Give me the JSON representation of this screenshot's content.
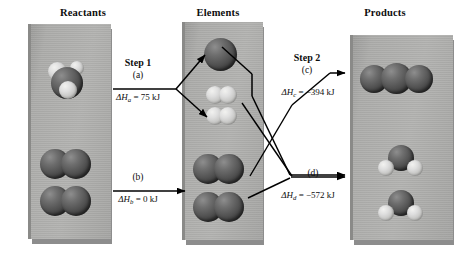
{
  "figure": {
    "type": "energy-diagram"
  },
  "columns": [
    {
      "key": "reactants",
      "title": "Reactants"
    },
    {
      "key": "elements",
      "title": "Elements"
    },
    {
      "key": "products",
      "title": "Products"
    }
  ],
  "panels": {
    "reactants": {
      "title": "Reactants",
      "molecules": [
        {
          "name": "methane",
          "formula": "CH4",
          "shape": "tetrahedral",
          "atoms": "1 dark carbon, light hydrogens"
        },
        {
          "name": "oxygen-1",
          "formula": "O2",
          "shape": "diatomic",
          "atoms": "2 dark oxygens"
        },
        {
          "name": "oxygen-2",
          "formula": "O2",
          "shape": "diatomic",
          "atoms": "2 dark oxygens"
        }
      ]
    },
    "elements": {
      "title": "Elements",
      "molecules": [
        {
          "name": "carbon",
          "formula": "C",
          "shape": "single-atom",
          "atoms": "1 dark carbon"
        },
        {
          "name": "hydrogen-1",
          "formula": "H2",
          "shape": "diatomic",
          "atoms": "2 light hydrogens"
        },
        {
          "name": "hydrogen-2",
          "formula": "H2",
          "shape": "diatomic",
          "atoms": "2 light hydrogens"
        },
        {
          "name": "oxygen-1",
          "formula": "O2",
          "shape": "diatomic",
          "atoms": "2 dark oxygens"
        },
        {
          "name": "oxygen-2",
          "formula": "O2",
          "shape": "diatomic",
          "atoms": "2 dark oxygens"
        }
      ]
    },
    "products": {
      "title": "Products",
      "molecules": [
        {
          "name": "carbon-dioxide",
          "formula": "CO2",
          "shape": "linear-triatomic",
          "atoms": "3 dark spheres"
        },
        {
          "name": "water-1",
          "formula": "H2O",
          "shape": "bent",
          "atoms": "1 dark oxygen, 2 light hydrogens"
        },
        {
          "name": "water-2",
          "formula": "H2O",
          "shape": "bent",
          "atoms": "1 dark oxygen, 2 light hydrogens"
        }
      ]
    }
  },
  "steps": [
    {
      "id": "a",
      "step_label": "Step 1",
      "paren_label": "(a)",
      "symbol": "ΔH",
      "subscript": "a",
      "equals": "=",
      "value": "75 kJ",
      "enthalpy_text": "ΔHa = 75 kJ",
      "enthalpy_kj": 75,
      "from": "reactants",
      "to": "elements"
    },
    {
      "id": "b",
      "step_label": "",
      "paren_label": "(b)",
      "symbol": "ΔH",
      "subscript": "b",
      "equals": "=",
      "value": "0 kJ",
      "enthalpy_text": "ΔHb = 0 kJ",
      "enthalpy_kj": 0,
      "from": "reactants",
      "to": "elements"
    },
    {
      "id": "c",
      "step_label": "Step 2",
      "paren_label": "(c)",
      "symbol": "ΔH",
      "subscript": "c",
      "equals": "=",
      "value": "−394 kJ",
      "enthalpy_text": "ΔHc = −394 kJ",
      "enthalpy_kj": -394,
      "from": "elements",
      "to": "products"
    },
    {
      "id": "d",
      "step_label": "",
      "paren_label": "(d)",
      "symbol": "ΔH",
      "subscript": "d",
      "equals": "=",
      "value": "−572 kJ",
      "enthalpy_text": "ΔHd = −572 kJ",
      "enthalpy_kj": -572,
      "from": "elements",
      "to": "products"
    }
  ],
  "colors": {
    "background": "#ffffff",
    "panel_face": "#adadab",
    "panel_shadow": "#8d8d8d",
    "atom_dark": "#4e4e4e",
    "atom_light": "#dedede",
    "text": "#0d0d0d",
    "arrow": "#000000"
  }
}
